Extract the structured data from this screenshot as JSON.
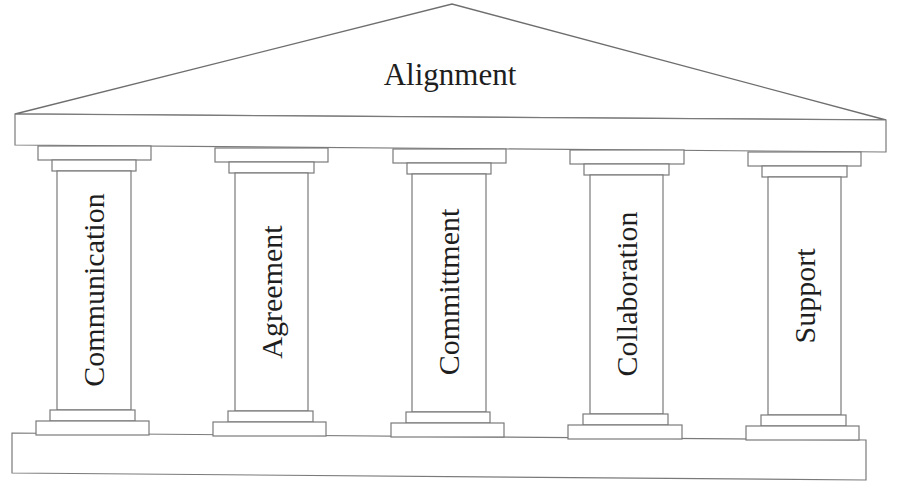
{
  "diagram": {
    "type": "temple-pillars",
    "roof": {
      "label": "Alignment"
    },
    "pillars": [
      {
        "label": "Communication"
      },
      {
        "label": "Agreement"
      },
      {
        "label": "Committment"
      },
      {
        "label": "Collaboration"
      },
      {
        "label": "Support"
      }
    ],
    "colors": {
      "line": "#7a7a7a",
      "text": "#1e1e1e",
      "background": "#ffffff"
    }
  }
}
